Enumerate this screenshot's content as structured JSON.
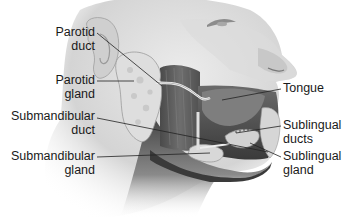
{
  "figure": {
    "style": "grayscale illustration",
    "colors": {
      "background": "#ffffff",
      "skin_light": "#e6e6e6",
      "skin_mid": "#bdbdbd",
      "skin_dark": "#5a5a5a",
      "gland": "#d8d8d8",
      "leader_line": "#222222",
      "label_text": "#1a1a1a"
    }
  },
  "labels": [
    {
      "id": "parotid-duct",
      "lines": [
        "Parotid",
        "duct"
      ],
      "side": "left"
    },
    {
      "id": "parotid-gland",
      "lines": [
        "Parotid",
        "gland"
      ],
      "side": "left"
    },
    {
      "id": "submandibular-duct",
      "lines": [
        "Submandibular",
        "duct"
      ],
      "side": "left"
    },
    {
      "id": "submandibular-gland",
      "lines": [
        "Submandibular",
        "gland"
      ],
      "side": "left"
    },
    {
      "id": "tongue",
      "lines": [
        "Tongue"
      ],
      "side": "right"
    },
    {
      "id": "sublingual-ducts",
      "lines": [
        "Sublingual",
        "ducts"
      ],
      "side": "right"
    },
    {
      "id": "sublingual-gland",
      "lines": [
        "Sublingual",
        "gland"
      ],
      "side": "right"
    }
  ]
}
